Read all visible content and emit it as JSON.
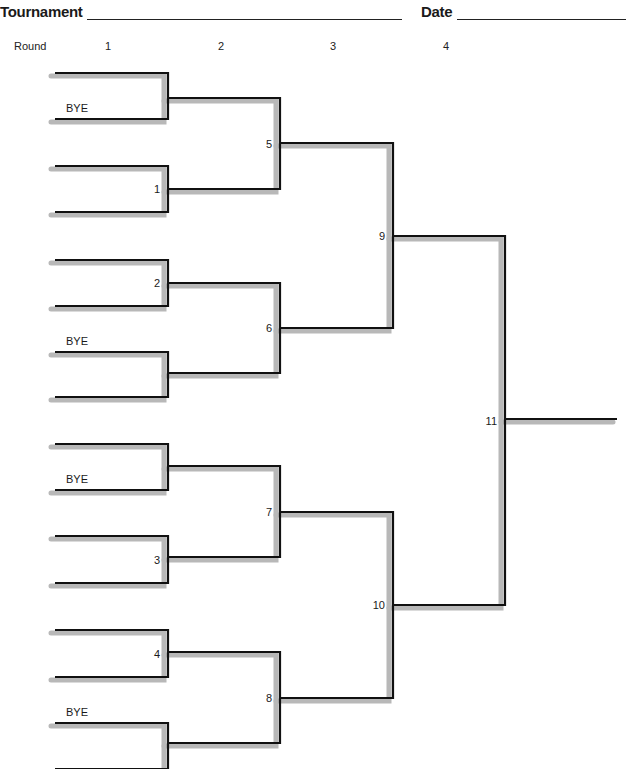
{
  "header": {
    "tournament_label": "Tournament",
    "date_label": "Date",
    "tournament_value": "",
    "date_value": ""
  },
  "rounds": {
    "label": "Round",
    "numbers": [
      "1",
      "2",
      "3",
      "4"
    ]
  },
  "colors": {
    "line": "#111111",
    "shadow": "#b8b8b8",
    "text": "#1a1a1a"
  },
  "bracket": {
    "round1": [
      {
        "top_y": 73,
        "bottom_y": 119,
        "label": "",
        "bye": "bottom"
      },
      {
        "top_y": 166,
        "bottom_y": 212,
        "label": "1",
        "bye": ""
      },
      {
        "top_y": 260,
        "bottom_y": 306,
        "label": "2",
        "bye": ""
      },
      {
        "top_y": 352,
        "bottom_y": 397,
        "label": "",
        "bye": "top"
      },
      {
        "top_y": 444,
        "bottom_y": 490,
        "label": "",
        "bye": "bottom"
      },
      {
        "top_y": 536,
        "bottom_y": 583,
        "label": "3",
        "bye": ""
      },
      {
        "top_y": 630,
        "bottom_y": 677,
        "label": "4",
        "bye": ""
      },
      {
        "top_y": 723,
        "bottom_y": 769,
        "label": "",
        "bye": "top"
      }
    ],
    "round2": [
      {
        "top_y": 98,
        "bottom_y": 189,
        "label": "5"
      },
      {
        "top_y": 283,
        "bottom_y": 373,
        "label": "6"
      },
      {
        "top_y": 466,
        "bottom_y": 557,
        "label": "7"
      },
      {
        "top_y": 652,
        "bottom_y": 743,
        "label": "8"
      }
    ],
    "round3": [
      {
        "top_y": 143,
        "bottom_y": 328,
        "label": "9"
      },
      {
        "top_y": 512,
        "bottom_y": 698,
        "label": "10"
      }
    ],
    "round4": [
      {
        "top_y": 236,
        "bottom_y": 605,
        "label": "11"
      }
    ],
    "final_line": {
      "y": 419,
      "x_end": 617
    },
    "bye_text": "BYE",
    "columns_x": {
      "round1_left": 55,
      "round1_right": 168,
      "round2_right": 280,
      "round3_right": 393,
      "round4_right": 505
    }
  }
}
